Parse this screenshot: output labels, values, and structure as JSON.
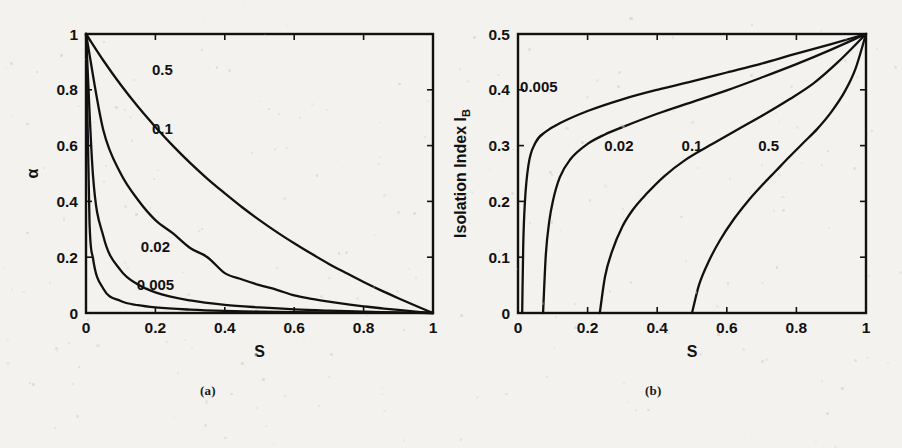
{
  "figure": {
    "background_color": "#f4f2ee",
    "ink_color": "#111111",
    "panels": [
      {
        "id": "a",
        "caption": "(a)",
        "xlabel": "S",
        "ylabel": "α",
        "ylabel_sub": "",
        "xticks": [
          "0",
          "0.2",
          "0.4",
          "0.6",
          "0.8",
          "1"
        ],
        "yticks": [
          "0",
          "0.2",
          "0.4",
          "0.6",
          "0.8",
          "1"
        ],
        "curve_labels": [
          "0.5",
          "0.1",
          "0.02",
          "0.005"
        ]
      },
      {
        "id": "b",
        "caption": "(b)",
        "xlabel": "S",
        "ylabel": "Isolation Index I",
        "ylabel_sub": "B",
        "xticks": [
          "0",
          "0.2",
          "0.4",
          "0.6",
          "0.8",
          "1"
        ],
        "yticks": [
          "0",
          "0.1",
          "0.2",
          "0.3",
          "0.4",
          "0.5"
        ],
        "curve_labels": [
          "0.005",
          "0.02",
          "0.1",
          "0.5"
        ]
      }
    ]
  },
  "chart_data": [
    {
      "type": "line",
      "panel": "a",
      "title": "",
      "xlabel": "S",
      "ylabel": "α",
      "xlim": [
        0,
        1
      ],
      "ylim": [
        0,
        1
      ],
      "xticks": [
        0,
        0.2,
        0.4,
        0.6,
        0.8,
        1
      ],
      "yticks": [
        0,
        0.2,
        0.4,
        0.6,
        0.8,
        1
      ],
      "grid": false,
      "legend": "inline-curve-labels",
      "model": "alpha = k(1-S) / (k(1-S) + S)",
      "series": [
        {
          "name": "0.5",
          "k": 0.5,
          "label_x": 0.22,
          "label_y": 0.87,
          "x": [
            0,
            0.05,
            0.1,
            0.15,
            0.2,
            0.25,
            0.3,
            0.35,
            0.4,
            0.45,
            0.5,
            0.55,
            0.6,
            0.65,
            0.7,
            0.75,
            0.8,
            0.85,
            0.9,
            0.95,
            1
          ],
          "values": [
            1,
            0.905,
            0.818,
            0.739,
            0.667,
            0.6,
            0.538,
            0.481,
            0.429,
            0.379,
            0.333,
            0.29,
            0.25,
            0.212,
            0.176,
            0.143,
            0.111,
            0.081,
            0.053,
            0.026,
            0
          ]
        },
        {
          "name": "0.1",
          "k": 0.1,
          "label_x": 0.22,
          "label_y": 0.66,
          "x": [
            0,
            0.05,
            0.1,
            0.15,
            0.2,
            0.25,
            0.3,
            0.35,
            0.4,
            0.45,
            0.5,
            0.55,
            0.6,
            0.65,
            0.7,
            0.75,
            0.8,
            0.85,
            0.9,
            0.95,
            1
          ],
          "values": [
            1,
            0.655,
            0.5,
            0.405,
            0.333,
            0.286,
            0.233,
            0.2,
            0.143,
            0.12,
            0.1,
            0.083,
            0.063,
            0.051,
            0.041,
            0.032,
            0.024,
            0.017,
            0.011,
            0.005,
            0
          ]
        },
        {
          "name": "0.02",
          "k": 0.02,
          "label_x": 0.2,
          "label_y": 0.235,
          "x": [
            0,
            0.02,
            0.05,
            0.1,
            0.15,
            0.2,
            0.3,
            0.4,
            0.5,
            0.6,
            0.7,
            0.8,
            0.9,
            0.95,
            1
          ],
          "values": [
            1,
            0.495,
            0.275,
            0.153,
            0.102,
            0.074,
            0.045,
            0.029,
            0.02,
            0.013,
            0.0085,
            0.005,
            0.0022,
            0.001,
            0
          ]
        },
        {
          "name": "0.005",
          "k": 0.005,
          "label_x": 0.2,
          "label_y": 0.1,
          "x": [
            0,
            0.01,
            0.02,
            0.05,
            0.1,
            0.15,
            0.2,
            0.3,
            0.4,
            0.5,
            0.6,
            0.8,
            0.9,
            1
          ],
          "values": [
            1,
            0.331,
            0.197,
            0.087,
            0.043,
            0.028,
            0.02,
            0.012,
            0.0074,
            0.005,
            0.0033,
            0.00124,
            0.00055,
            0
          ]
        }
      ]
    },
    {
      "type": "line",
      "panel": "b",
      "title": "",
      "xlabel": "S",
      "ylabel": "Isolation Index I_B",
      "xlim": [
        0,
        1
      ],
      "ylim": [
        0,
        0.5
      ],
      "xticks": [
        0,
        0.2,
        0.4,
        0.6,
        0.8,
        1
      ],
      "yticks": [
        0,
        0.1,
        0.2,
        0.3,
        0.4,
        0.5
      ],
      "grid": false,
      "legend": "inline-curve-labels",
      "model": "I_B rises from 0 at S_min to 0.5 at S = 1",
      "series": [
        {
          "name": "0.005",
          "k": 0.005,
          "label_x": 0.06,
          "label_y": 0.405,
          "x_intercept": 0.012,
          "x": [
            0.012,
            0.015,
            0.02,
            0.03,
            0.05,
            0.08,
            0.12,
            0.2,
            0.3,
            0.4,
            0.5,
            0.6,
            0.7,
            0.8,
            0.9,
            1
          ],
          "values": [
            0,
            0.12,
            0.2,
            0.265,
            0.305,
            0.325,
            0.34,
            0.362,
            0.383,
            0.4,
            0.415,
            0.431,
            0.447,
            0.465,
            0.482,
            0.5
          ]
        },
        {
          "name": "0.02",
          "k": 0.02,
          "label_x": 0.29,
          "label_y": 0.3,
          "x_intercept": 0.072,
          "x": [
            0.072,
            0.08,
            0.09,
            0.1,
            0.12,
            0.15,
            0.2,
            0.25,
            0.3,
            0.4,
            0.5,
            0.6,
            0.7,
            0.8,
            0.9,
            1
          ],
          "values": [
            0,
            0.105,
            0.165,
            0.2,
            0.243,
            0.275,
            0.303,
            0.32,
            0.333,
            0.357,
            0.378,
            0.399,
            0.422,
            0.446,
            0.472,
            0.5
          ]
        },
        {
          "name": "0.1",
          "k": 0.1,
          "label_x": 0.5,
          "label_y": 0.3,
          "x_intercept": 0.235,
          "x": [
            0.235,
            0.25,
            0.27,
            0.3,
            0.33,
            0.37,
            0.42,
            0.48,
            0.55,
            0.62,
            0.7,
            0.78,
            0.85,
            0.92,
            1
          ],
          "values": [
            0,
            0.065,
            0.11,
            0.155,
            0.185,
            0.214,
            0.245,
            0.274,
            0.3,
            0.325,
            0.353,
            0.383,
            0.412,
            0.45,
            0.5
          ]
        },
        {
          "name": "0.5",
          "k": 0.5,
          "label_x": 0.72,
          "label_y": 0.3,
          "x_intercept": 0.5,
          "x": [
            0.5,
            0.52,
            0.55,
            0.58,
            0.62,
            0.66,
            0.7,
            0.74,
            0.78,
            0.82,
            0.86,
            0.9,
            0.94,
            0.97,
            1
          ],
          "values": [
            0,
            0.05,
            0.095,
            0.13,
            0.168,
            0.2,
            0.228,
            0.254,
            0.28,
            0.305,
            0.33,
            0.36,
            0.398,
            0.438,
            0.5
          ]
        }
      ]
    }
  ]
}
